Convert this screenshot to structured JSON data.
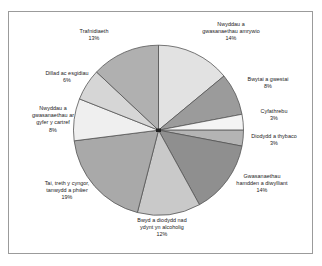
{
  "chart_data": {
    "type": "pie",
    "title": "",
    "subtitle": "",
    "xlabel": "",
    "ylabel": "",
    "legend_position": "none",
    "grid": false,
    "labels_show_percent": true,
    "start_angle_deg": 90,
    "direction": "clockwise",
    "total_percent": 100,
    "categories": [
      "Nwyddau a gwasanaethau amrywio",
      "Bwytai a gwestai",
      "Cyfathrebu",
      "Diodydd a thybaco",
      "Gwasanaethau hamdden a diwylliant",
      "Bwyd a diodydd nad ydynt yn alcoholig",
      "Tai, treth y cyngor, tanwydd a phŵer",
      "Nwyddau a gwasanaethau ar gyfer y cartref",
      "Dillad ac esgidiau",
      "Trafnidiaeth"
    ],
    "values": [
      14,
      8,
      3,
      3,
      14,
      12,
      19,
      8,
      6,
      13
    ],
    "colors": [
      "#e2e2e2",
      "#9b9b9b",
      "#f4f4f4",
      "#b4b4b4",
      "#8f8f8f",
      "#c9c9c9",
      "#a9a9a9",
      "#efefef",
      "#d6d6d6",
      "#b0b0b0"
    ],
    "slice_edge_color": "#555555",
    "slices": [
      {
        "label": "Nwyddau a gwasanaethau amrywio",
        "percent_label": "14%",
        "value": 14,
        "color": "#e2e2e2",
        "label_lines": [
          "Nwyddau a",
          "gwasanaethau amrywio"
        ]
      },
      {
        "label": "Bwytai a gwestai",
        "percent_label": "8%",
        "value": 8,
        "color": "#9b9b9b",
        "label_lines": [
          "Bwytai a gwestai"
        ]
      },
      {
        "label": "Cyfathrebu",
        "percent_label": "3%",
        "value": 3,
        "color": "#f4f4f4",
        "label_lines": [
          "Cyfathrebu"
        ]
      },
      {
        "label": "Diodydd a thybaco",
        "percent_label": "3%",
        "value": 3,
        "color": "#b4b4b4",
        "label_lines": [
          "Diodydd a thybaco"
        ]
      },
      {
        "label": "Gwasanaethau hamdden a diwylliant",
        "percent_label": "14%",
        "value": 14,
        "color": "#8f8f8f",
        "label_lines": [
          "Gwasanaethau",
          "hamdden a diwylliant"
        ]
      },
      {
        "label": "Bwyd a diodydd nad ydynt yn alcoholig",
        "percent_label": "12%",
        "value": 12,
        "color": "#c9c9c9",
        "label_lines": [
          "Bwyd a diodydd nad",
          "ydynt yn alcoholig"
        ]
      },
      {
        "label": "Tai, treth y cyngor, tanwydd a phŵer",
        "percent_label": "19%",
        "value": 19,
        "color": "#a9a9a9",
        "label_lines": [
          "Tai, treth y cyngor,",
          "tanwydd a phŵer"
        ]
      },
      {
        "label": "Nwyddau a gwasanaethau ar gyfer y cartref",
        "percent_label": "8%",
        "value": 8,
        "color": "#efefef",
        "label_lines": [
          "Nwyddau a",
          "gwasanaethau ar",
          "gyfer y cartref"
        ]
      },
      {
        "label": "Dillad ac esgidiau",
        "percent_label": "6%",
        "value": 6,
        "color": "#d6d6d6",
        "label_lines": [
          "Dillad ac esgidiau"
        ]
      },
      {
        "label": "Trafnidiaeth",
        "percent_label": "13%",
        "value": 13,
        "color": "#b0b0b0",
        "label_lines": [
          "Trafnidiaeth"
        ]
      }
    ]
  },
  "labels": {
    "amrywio": "Nwyddau a\ngwasanaethau amrywio\n14%",
    "bwytai": "Bwytai a gwestai\n8%",
    "cyfathrebu": "Cyfathrebu\n3%",
    "diodydd": "Diodydd a thybaco\n3%",
    "hamdden": "Gwasanaethau\nhamdden a diwylliant\n14%",
    "bwyd": "Bwyd a diodydd nad\nydynt yn alcoholig\n12%",
    "tai": "Tai, treth y cyngor,\ntanwydd a phŵer\n19%",
    "cartref": "Nwyddau a\ngwasanaethau ar\ngyfer y cartref\n8%",
    "dillad": "Dillad ac esgidiau\n6%",
    "trafnidiaeth": "Trafnidiaeth\n13%"
  },
  "style": {
    "frame_border_color": "#9b9b9b",
    "background": "#ffffff",
    "text_color": "#1a1a1a",
    "slice_edge_color": "#555555"
  }
}
